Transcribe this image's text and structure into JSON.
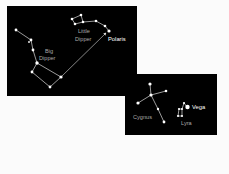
{
  "diagram": {
    "colors": {
      "background": "#fbfbfb",
      "panel": "#000000",
      "star": "#ffffff",
      "line": "#dcdcdc",
      "label_dim": "#a9a9a9",
      "label_bright": "#ffffff"
    },
    "panels": [
      {
        "name": "northern-sky",
        "constellations": [
          {
            "name": "Big Dipper",
            "label_lines": [
              "Big",
              "Dipper"
            ]
          },
          {
            "name": "Little Dipper",
            "label_lines": [
              "Little",
              "Dipper"
            ]
          }
        ],
        "named_stars": [
          {
            "name": "Polaris"
          }
        ],
        "pointer": "Big Dipper pointer stars to Polaris"
      },
      {
        "name": "summer-triangle-region",
        "constellations": [
          {
            "name": "Cygnus",
            "label_lines": [
              "Cygnus"
            ]
          },
          {
            "name": "Lyra",
            "label_lines": [
              "Lyra"
            ]
          }
        ],
        "named_stars": [
          {
            "name": "Vega"
          }
        ]
      }
    ],
    "labels": {
      "big_dipper_1": "Big",
      "big_dipper_2": "Dipper",
      "little_dipper_1": "Little",
      "little_dipper_2": "Dipper",
      "polaris": "Polaris",
      "cygnus": "Cygnus",
      "lyra": "Lyra",
      "vega": "Vega"
    }
  }
}
